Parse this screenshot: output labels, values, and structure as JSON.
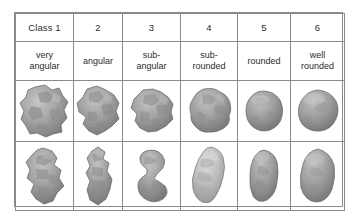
{
  "figure": {
    "type": "table",
    "columns": 6,
    "grain_rows": 2,
    "colors": {
      "border": "#8a8a8a",
      "text": "#2b2b2b",
      "background": "#ffffff",
      "grain_mid": "#9a9a9a",
      "grain_light": "#c9c9c9",
      "grain_dark": "#6f6f6f"
    }
  },
  "table": {
    "class_headers": [
      "Class 1",
      "2",
      "3",
      "4",
      "5",
      "6"
    ],
    "class_names": [
      "very\nangular",
      "angular",
      "sub-\nangular",
      "sub-\nrounded",
      "rounded",
      "well\nrounded"
    ],
    "class_names_flat": [
      "very angular",
      "angular",
      "sub-angular",
      "sub-rounded",
      "rounded",
      "well rounded"
    ],
    "class_name_lines": [
      [
        "very",
        "angular"
      ],
      [
        "angular"
      ],
      [
        "sub-",
        "angular"
      ],
      [
        "sub-",
        "rounded"
      ],
      [
        "rounded"
      ],
      [
        "well",
        "rounded"
      ]
    ],
    "grain_row_1": [
      "grain-very-angular-a",
      "grain-angular-a",
      "grain-sub-angular-a",
      "grain-sub-rounded-a",
      "grain-rounded-a",
      "grain-well-rounded-a"
    ],
    "grain_row_2": [
      "grain-very-angular-b",
      "grain-angular-b",
      "grain-sub-angular-b",
      "grain-sub-rounded-b",
      "grain-rounded-b",
      "grain-well-rounded-b"
    ]
  }
}
